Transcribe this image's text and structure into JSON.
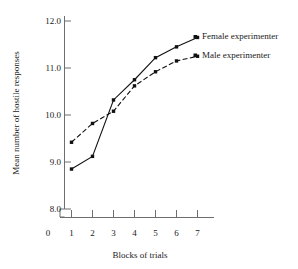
{
  "chart_data": {
    "type": "line",
    "title": "",
    "xlabel": "Blocks of trials",
    "ylabel": "Mean number of hostile responses",
    "x": [
      1,
      2,
      3,
      4,
      5,
      6,
      7
    ],
    "xticklabels": [
      "1",
      "2",
      "3",
      "4",
      "5",
      "6",
      "7"
    ],
    "x_origin_label": "0",
    "xlim": [
      0.55,
      7.45
    ],
    "yticklabels": [
      "8.0",
      "9.0",
      "10.0",
      "11.0",
      "12.0"
    ],
    "yticks": [
      8.0,
      9.0,
      10.0,
      11.0,
      12.0
    ],
    "ylim": [
      8.0,
      12.0
    ],
    "grid": false,
    "legend_position": "right-inside",
    "series": [
      {
        "name": "Female experimenter",
        "style": "solid",
        "color": "#111111",
        "marker": "square",
        "values": [
          8.85,
          9.12,
          10.32,
          10.75,
          11.22,
          11.45,
          11.65
        ]
      },
      {
        "name": "Male experimenter",
        "style": "dashed",
        "color": "#111111",
        "marker": "square",
        "values": [
          9.42,
          9.82,
          10.08,
          10.62,
          10.92,
          11.15,
          11.25
        ]
      }
    ]
  },
  "legend": {
    "items": [
      {
        "label": "Female experimenter"
      },
      {
        "label": "Male experimenter"
      }
    ]
  },
  "axes": {
    "y_title": "Mean number of hostile responses",
    "x_title": "Blocks of trials",
    "origin_label": "0"
  }
}
